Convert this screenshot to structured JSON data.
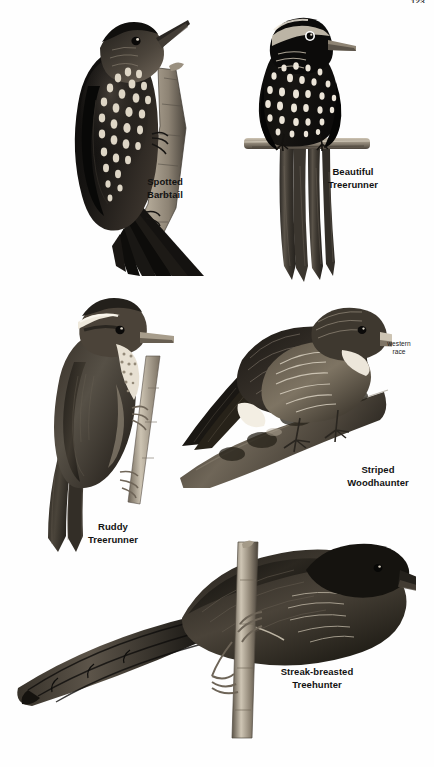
{
  "page": {
    "number": "123",
    "background_color": "#ffffff",
    "type": "field-guide-plate",
    "ink_color": "#121212"
  },
  "plate": {
    "title": "",
    "figure_count": 5,
    "figures": [
      {
        "id": "spotted-barbtail",
        "label": "Spotted\nBarbtail",
        "caption_lines": [
          "Spotted",
          "Barbtail"
        ],
        "pose": "clinging to vertical branch, facing upper-right, stiff spiny tail",
        "plumage": "dark brown with cream teardrop spots on breast and belly",
        "position": {
          "x": 40,
          "y": 10,
          "w": 180,
          "h": 265
        }
      },
      {
        "id": "beautiful-treerunner",
        "label": "Beautiful\nTreerunner",
        "caption_lines": [
          "Beautiful",
          "Treerunner"
        ],
        "pose": "front view perched on horizontal branch, long tail hanging down",
        "plumage": "blackish with bold white drop-shaped spots, pale face stripe",
        "position": {
          "x": 246,
          "y": 8,
          "w": 120,
          "h": 280
        }
      },
      {
        "id": "ruddy-treerunner",
        "label": "Ruddy\nTreerunner",
        "caption_lines": [
          "Ruddy",
          "Treerunner"
        ],
        "pose": "perched on slanting twig, facing right, long tail down-left",
        "plumage": "rufous brown above, white supercilium, pale spotted throat",
        "position": {
          "x": 30,
          "y": 295,
          "w": 165,
          "h": 260
        }
      },
      {
        "id": "striped-woodhaunter",
        "label": "Striped\nWoodhaunter",
        "caption_lines": [
          "Striped",
          "Woodhaunter"
        ],
        "annotation": "western\nrace",
        "annotation_lines": [
          "western",
          "race"
        ],
        "pose": "crouched on mossy log, facing right",
        "plumage": "olive-brown, finely streaked breast, long pale bill",
        "position": {
          "x": 180,
          "y": 300,
          "w": 210,
          "h": 185
        }
      },
      {
        "id": "streak-breasted-treehunter",
        "label": "Streak-breasted\nTreehunter",
        "caption_lines": [
          "Streak-breasted",
          "Treehunter"
        ],
        "pose": "perched on vertical stem, facing right, long tail to left",
        "plumage": "dark brown with fine pale breast streaking, heavy bill",
        "position": {
          "x": 10,
          "y": 545,
          "w": 400,
          "h": 180
        }
      }
    ]
  }
}
